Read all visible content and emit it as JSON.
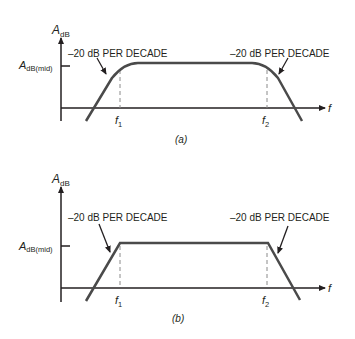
{
  "figures": [
    {
      "id": "a",
      "caption": "(a)",
      "y_axis_label": "A",
      "y_axis_sub": "dB",
      "mid_label": "A",
      "mid_sub": "dB(mid)",
      "x_axis_label": "f",
      "f1_label": "f",
      "f1_sub": "1",
      "f2_label": "f",
      "f2_sub": "2",
      "left_annotation": "–20 dB PER DECADE",
      "right_annotation": "–20 dB PER DECADE",
      "curve_style": "actual (rounded corners)"
    },
    {
      "id": "b",
      "caption": "(b)",
      "y_axis_label": "A",
      "y_axis_sub": "dB",
      "mid_label": "A",
      "mid_sub": "dB(mid)",
      "x_axis_label": "f",
      "f1_label": "f",
      "f1_sub": "1",
      "f2_label": "f",
      "f2_sub": "2",
      "left_annotation": "–20 dB PER DECADE",
      "right_annotation": "–20 dB PER DECADE",
      "curve_style": "ideal (Bode asymptotes)"
    }
  ],
  "colors": {
    "curve": "#4a4a4a",
    "axis": "#231f20",
    "dashed": "#8a8a8a"
  }
}
